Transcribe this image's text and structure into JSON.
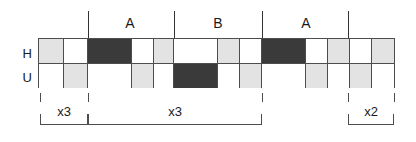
{
  "figure": {
    "row_labels": [
      "H",
      "U"
    ],
    "colors": {
      "white": "#ffffff",
      "gray": "#e3e3e3",
      "dark": "#3a3a3a",
      "line": "#4d4d4d",
      "text": "#1a1a1a"
    },
    "segment_labels": [
      {
        "text": "A",
        "center_x": 130
      },
      {
        "text": "B",
        "center_x": 218
      },
      {
        "text": "A",
        "center_x": 306
      }
    ],
    "segment_dividers": [
      88,
      174,
      262,
      348
    ],
    "rows": [
      {
        "name": "H",
        "cells": [
          {
            "fill": "gray",
            "x": 39,
            "w": 25
          },
          {
            "fill": "white",
            "x": 64,
            "w": 24
          },
          {
            "fill": "dark",
            "x": 88,
            "w": 44
          },
          {
            "fill": "white",
            "x": 132,
            "w": 22
          },
          {
            "fill": "gray",
            "x": 154,
            "w": 20
          },
          {
            "fill": "white",
            "x": 174,
            "w": 44
          },
          {
            "fill": "gray",
            "x": 218,
            "w": 22
          },
          {
            "fill": "white",
            "x": 240,
            "w": 22
          },
          {
            "fill": "dark",
            "x": 262,
            "w": 44
          },
          {
            "fill": "white",
            "x": 306,
            "w": 22
          },
          {
            "fill": "gray",
            "x": 328,
            "w": 22
          },
          {
            "fill": "white",
            "x": 350,
            "w": 22
          },
          {
            "fill": "gray",
            "x": 372,
            "w": 22
          }
        ]
      },
      {
        "name": "U",
        "cells": [
          {
            "fill": "white",
            "x": 39,
            "w": 25
          },
          {
            "fill": "gray",
            "x": 64,
            "w": 24
          },
          {
            "fill": "white",
            "x": 88,
            "w": 44
          },
          {
            "fill": "gray",
            "x": 132,
            "w": 22
          },
          {
            "fill": "white",
            "x": 154,
            "w": 20
          },
          {
            "fill": "dark",
            "x": 174,
            "w": 44
          },
          {
            "fill": "white",
            "x": 218,
            "w": 22
          },
          {
            "fill": "gray",
            "x": 240,
            "w": 22
          },
          {
            "fill": "white",
            "x": 262,
            "w": 44
          },
          {
            "fill": "gray",
            "x": 306,
            "w": 22
          },
          {
            "fill": "white",
            "x": 328,
            "w": 22
          },
          {
            "fill": "gray",
            "x": 350,
            "w": 22
          },
          {
            "fill": "white",
            "x": 372,
            "w": 22
          }
        ]
      }
    ],
    "bottom_ticks": [
      40,
      88,
      262,
      348,
      394
    ],
    "brackets": [
      {
        "label": "x3",
        "x": 40,
        "w": 48
      },
      {
        "label": "x3",
        "x": 88,
        "w": 174
      },
      {
        "label": "x2",
        "x": 348,
        "w": 46
      }
    ]
  }
}
